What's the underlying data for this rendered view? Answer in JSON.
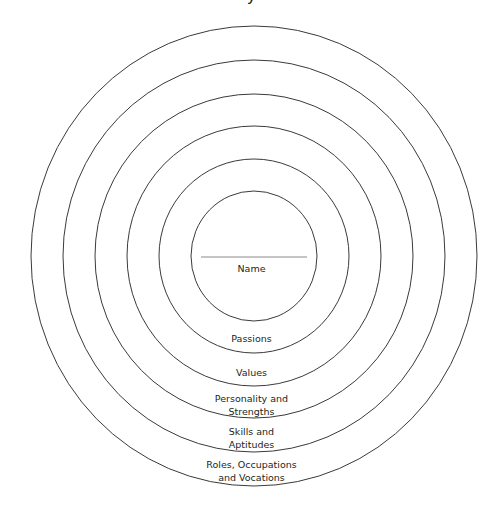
{
  "diagram": {
    "title_fragment": "y",
    "center": {
      "x": 254,
      "y": 256
    },
    "stroke_color": "#3a3a3a",
    "center_line_color": "#8a8a8a",
    "rings": [
      {
        "id": "ring-1",
        "rx": 63,
        "ry": 65,
        "label": "Name"
      },
      {
        "id": "ring-2",
        "rx": 95,
        "ry": 97,
        "label": "Passions"
      },
      {
        "id": "ring-3",
        "rx": 127,
        "ry": 130,
        "label": "Values"
      },
      {
        "id": "ring-4",
        "rx": 159,
        "ry": 162,
        "label_lines": [
          "Personality and",
          "Strengths"
        ]
      },
      {
        "id": "ring-5",
        "rx": 191,
        "ry": 196,
        "label_lines": [
          "Skills and",
          "Aptitudes"
        ]
      },
      {
        "id": "ring-6",
        "rx": 223,
        "ry": 230,
        "label_lines": [
          "Roles, Occupations",
          "and Vocations"
        ]
      }
    ],
    "labels": {
      "name": "Name",
      "passions": "Passions",
      "values": "Values",
      "personality_line1": "Personality and",
      "personality_line2": "Strengths",
      "skills_line1": "Skills and",
      "skills_line2": "Aptitudes",
      "roles_line1": "Roles, Occupations",
      "roles_line2": "and Vocations"
    }
  }
}
